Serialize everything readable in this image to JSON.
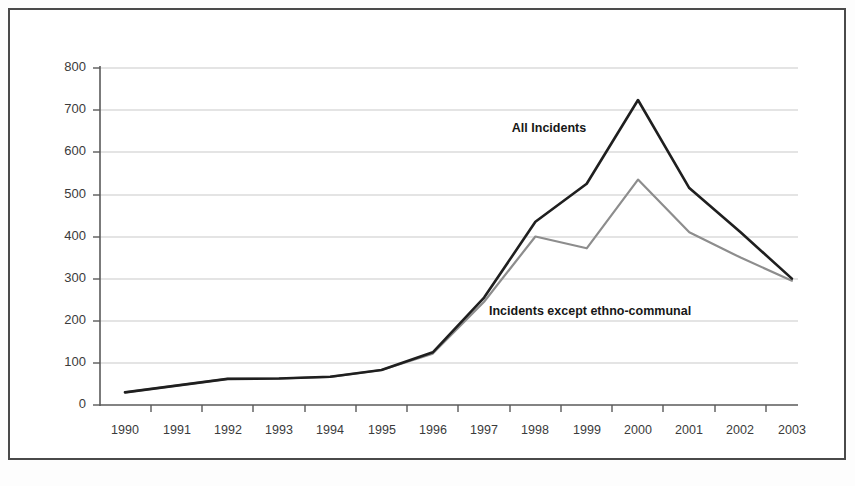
{
  "figure": {
    "background_color": "#ffffff",
    "frame_color": "#4a4a4a",
    "grid_color": "#c9c9c9",
    "axis_color": "#5a5a5a"
  },
  "annotations": {
    "all_incidents_label": "All Incidents",
    "except_ethno_label": "Incidents except ethno-communal"
  },
  "axis": {
    "y_ticks": [
      "800",
      "700",
      "600",
      "500",
      "400",
      "300",
      "200",
      "100",
      "0"
    ],
    "x_ticks": [
      "1990",
      "1991",
      "1992",
      "1993",
      "1994",
      "1995",
      "1996",
      "1997",
      "1998",
      "1999",
      "2000",
      "2001",
      "2002",
      "2003"
    ]
  },
  "chart_data": {
    "type": "line",
    "title": "",
    "subtitle": "",
    "xlabel": "",
    "ylabel": "",
    "xlim": [
      1990,
      2003
    ],
    "ylim": [
      0,
      800
    ],
    "ytick_interval": 100,
    "grid": true,
    "grid_axis": "y",
    "legend": "inline-annotations",
    "categories": [
      "1990",
      "1991",
      "1992",
      "1993",
      "1994",
      "1995",
      "1996",
      "1997",
      "1998",
      "1999",
      "2000",
      "2001",
      "2002",
      "2003"
    ],
    "series": [
      {
        "name": "All Incidents",
        "color": "#1f1f1f",
        "values": [
          30,
          46,
          62,
          63,
          67,
          83,
          125,
          255,
          435,
          525,
          724,
          515,
          410,
          300
        ]
      },
      {
        "name": "Incidents except ethno-communal",
        "color": "#8d8d8d",
        "values": [
          30,
          46,
          62,
          63,
          67,
          83,
          122,
          245,
          400,
          372,
          535,
          410,
          350,
          295
        ]
      }
    ]
  }
}
